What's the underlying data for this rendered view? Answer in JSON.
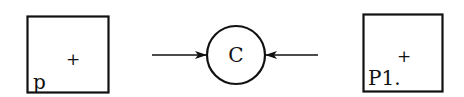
{
  "diagram": {
    "left_box": {
      "label": "p",
      "marker": "+"
    },
    "center_node": {
      "label": "C"
    },
    "right_box": {
      "label": "P1.",
      "marker": "+"
    },
    "edges": [
      {
        "from": "left",
        "to": "C",
        "direction": "into-C"
      },
      {
        "from": "right",
        "to": "C",
        "direction": "into-C"
      }
    ],
    "colors": {
      "stroke": "#111111",
      "background": "#ffffff"
    }
  }
}
